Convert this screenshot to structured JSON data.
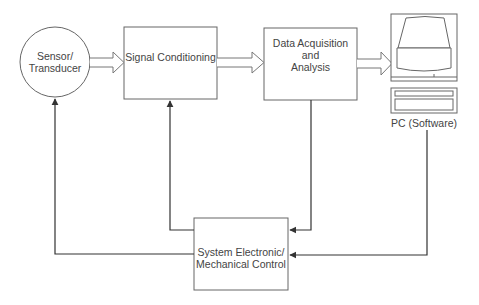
{
  "diagram": {
    "type": "block-diagram",
    "nodes": {
      "sensor": {
        "label_line1": "Sensor/",
        "label_line2": "Transducer",
        "shape": "circle"
      },
      "signal_conditioning": {
        "label": "Signal Conditioning",
        "shape": "rectangle"
      },
      "data_acquisition": {
        "label_line1": "Data Acquisition and",
        "label_line2": "Analysis",
        "shape": "rectangle"
      },
      "pc": {
        "label": "PC (Software)",
        "shape": "computer-icon"
      },
      "control": {
        "label_line1": "System Electronic/",
        "label_line2": "Mechanical Control",
        "shape": "rectangle"
      }
    },
    "edges": [
      {
        "from": "sensor",
        "to": "signal_conditioning",
        "style": "hollow-block-arrow"
      },
      {
        "from": "signal_conditioning",
        "to": "data_acquisition",
        "style": "hollow-block-arrow"
      },
      {
        "from": "data_acquisition",
        "to": "pc",
        "style": "hollow-block-arrow"
      },
      {
        "from": "data_acquisition",
        "to": "control",
        "style": "line-arrow"
      },
      {
        "from": "pc",
        "to": "control",
        "style": "line-arrow"
      },
      {
        "from": "control",
        "to": "signal_conditioning",
        "style": "line-arrow"
      },
      {
        "from": "control",
        "to": "sensor",
        "style": "line-arrow"
      }
    ],
    "colors": {
      "stroke": "#555555",
      "line": "#333333",
      "text": "#444444"
    }
  }
}
